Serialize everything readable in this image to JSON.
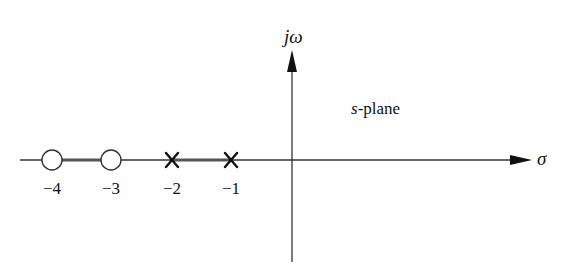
{
  "figure": {
    "type": "root-locus pole-zero plot",
    "plane_label_var": "s",
    "plane_label_rest": "-plane",
    "axes": {
      "horizontal_label": "σ",
      "vertical_label": "jω"
    },
    "ticks": [
      {
        "value": -4,
        "label": "−4"
      },
      {
        "value": -3,
        "label": "−3"
      },
      {
        "value": -2,
        "label": "−2"
      },
      {
        "value": -1,
        "label": "−1"
      }
    ],
    "zeros": [
      -4,
      -3
    ],
    "poles": [
      -2,
      -1
    ],
    "root_locus_segments": [
      [
        -4,
        -3
      ],
      [
        -2,
        -1
      ]
    ],
    "colors": {
      "ink": "#111111",
      "axis": "#333333",
      "locus": "#555555",
      "background": "#ffffff"
    }
  }
}
